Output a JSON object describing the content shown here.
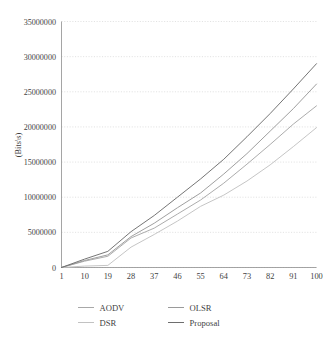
{
  "chart_data": {
    "type": "line",
    "title": "",
    "xlabel": "",
    "ylabel": "(Bits\\s)",
    "xlim": [
      1,
      100
    ],
    "ylim": [
      0,
      35000000
    ],
    "grid": "horizontal-dotted",
    "legend_position": "bottom",
    "x_tick_labels": [
      "1",
      "10",
      "19",
      "28",
      "37",
      "46",
      "55",
      "64",
      "73",
      "82",
      "91",
      "100"
    ],
    "y_tick_labels": [
      "0",
      "5000000",
      "10000000",
      "15000000",
      "20000000",
      "25000000",
      "30000000",
      "35000000"
    ],
    "y_tick_values": [
      0,
      5000000,
      10000000,
      15000000,
      20000000,
      25000000,
      30000000,
      35000000
    ],
    "x": [
      1,
      10,
      19,
      28,
      37,
      46,
      55,
      64,
      73,
      82,
      91,
      100
    ],
    "series": [
      {
        "name": "AODV",
        "color": "#a8a8a8",
        "values": [
          0,
          900000,
          1600000,
          4200000,
          5600000,
          7600000,
          9600000,
          12000000,
          14700000,
          17500000,
          20400000,
          23000000
        ]
      },
      {
        "name": "DSR",
        "color": "#c2c2c2",
        "values": [
          0,
          200000,
          300000,
          2900000,
          4700000,
          6600000,
          8700000,
          10300000,
          12300000,
          14600000,
          17200000,
          19900000
        ]
      },
      {
        "name": "OLSR",
        "color": "#9a9a9a",
        "values": [
          0,
          1000000,
          1800000,
          4400000,
          6300000,
          8500000,
          10600000,
          13300000,
          16200000,
          19400000,
          22600000,
          26100000
        ]
      },
      {
        "name": "Proposal",
        "color": "#6e6e6e",
        "values": [
          0,
          1200000,
          2300000,
          5100000,
          7400000,
          10000000,
          12600000,
          15400000,
          18600000,
          21900000,
          25400000,
          29000000
        ]
      }
    ]
  },
  "legend": {
    "entries": [
      {
        "label": "AODV"
      },
      {
        "label": "OLSR"
      },
      {
        "label": "DSR"
      },
      {
        "label": "Proposal"
      }
    ]
  },
  "axes": {
    "y_axis_title": "(Bits\\s)"
  }
}
